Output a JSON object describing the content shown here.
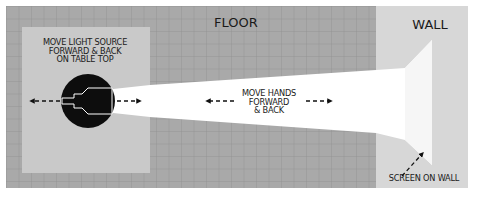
{
  "canvas": {
    "width": 477,
    "height": 199,
    "background": "#ffffff"
  },
  "colors": {
    "floor": "#a9a9a9",
    "floor_grid": "#8f8f8f",
    "table_top": "#c9c9c9",
    "wall": "#d7d7d7",
    "beam": "#ffffff",
    "screen": "#f4f4f4",
    "ink": "#111111"
  },
  "regions": {
    "floor": {
      "x": 6,
      "y": 6,
      "w": 370,
      "h": 182,
      "grid_step": 12.5
    },
    "wall": {
      "x": 376,
      "y": 6,
      "w": 92,
      "h": 182
    },
    "table_top": {
      "x": 22,
      "y": 27,
      "w": 128,
      "h": 146
    }
  },
  "labels": {
    "floor": "FLOOR",
    "wall": "WALL",
    "light_source": "MOVE LIGHT SOURCE\nFORWARD & BACK\nON TABLE TOP",
    "hands": "MOVE HANDS\nFORWARD\n& BACK",
    "screen": "SCREEN ON WALL"
  },
  "light_source": {
    "cx": 88,
    "cy": 101,
    "r": 27
  },
  "beam": {
    "points": "104,90 150,85 376,70 405,68 432,40 432,165 405,140 376,133 150,117 104,112"
  },
  "arrows": {
    "light_left": {
      "x1": 66,
      "y1": 101,
      "x2": 30,
      "y2": 101
    },
    "light_right": {
      "x1": 117,
      "y1": 101,
      "x2": 140,
      "y2": 101
    },
    "hands_left": {
      "x1": 235,
      "y1": 101,
      "x2": 207,
      "y2": 101
    },
    "hands_right": {
      "x1": 307,
      "y1": 101,
      "x2": 331,
      "y2": 101
    },
    "screen": {
      "x1": 410,
      "y1": 177,
      "x2": 425,
      "y2": 159
    }
  }
}
